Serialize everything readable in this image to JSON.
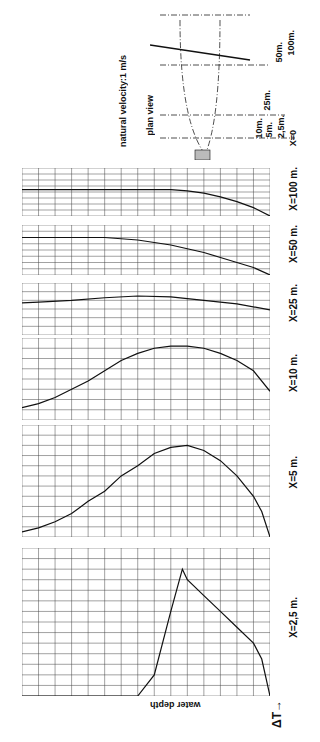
{
  "chart_data": {
    "type": "line",
    "title": "",
    "orientation": "rotated 90 degrees counter-clockwise",
    "xlabel": "water depth",
    "ylabel": "ΔT",
    "depth_ticks": [
      0,
      1,
      2,
      3,
      4,
      5,
      6,
      7,
      8,
      9,
      10,
      11,
      12,
      13,
      14,
      15
    ],
    "depth_unit": "m",
    "annotation": "natural velocity: 1 m/s",
    "inset": {
      "title": "plan view",
      "labels": [
        "100m.",
        "50m.",
        "25m.",
        "10m.",
        "5m.",
        "2,5m.",
        "X=0"
      ]
    },
    "series": [
      {
        "name": "X=2,5 m.",
        "dT_max": 14,
        "dT_ticks": [
          0,
          2,
          4,
          6,
          8,
          10,
          12,
          14,
          16
        ],
        "depth": [
          0,
          0.5,
          1,
          2,
          3,
          4,
          5,
          5.3,
          6,
          7,
          8,
          9,
          10,
          11,
          12,
          13,
          14,
          15
        ],
        "dT": [
          0,
          3.5,
          5,
          6.5,
          8,
          9.5,
          11,
          12,
          8,
          2,
          0,
          0,
          0,
          0,
          0,
          0,
          0,
          0
        ]
      },
      {
        "name": "X=5 m.",
        "dT_max": 11,
        "dT_ticks": [
          0,
          2,
          4,
          6,
          8,
          10,
          11
        ],
        "depth": [
          0,
          0.5,
          1,
          2,
          3,
          4,
          5,
          6,
          7,
          8,
          9,
          10,
          11,
          12,
          13,
          14,
          15
        ],
        "dT": [
          0,
          2.5,
          4,
          6,
          7.5,
          8.5,
          9,
          8.8,
          8.2,
          7,
          6,
          4.5,
          3.5,
          2.3,
          1.5,
          0.9,
          0.5
        ]
      },
      {
        "name": "X=10 m.",
        "dT_max": 8,
        "dT_ticks": [
          0,
          2,
          4,
          6,
          8
        ],
        "depth": [
          0,
          1,
          2,
          3,
          4,
          5,
          6,
          7,
          8,
          9,
          10,
          11,
          12,
          13,
          14,
          15
        ],
        "dT": [
          2.8,
          4.8,
          5.8,
          6.5,
          7.0,
          7.2,
          7.2,
          7.0,
          6.5,
          5.8,
          4.8,
          3.8,
          3.0,
          2.2,
          1.6,
          1.2
        ]
      },
      {
        "name": "X=25 m.",
        "dT_max": 6,
        "dT_ticks": [
          0,
          2,
          4,
          6
        ],
        "depth": [
          0,
          2,
          4,
          6,
          8,
          10,
          12,
          14,
          15
        ],
        "dT": [
          2.9,
          3.6,
          4.0,
          4.4,
          4.5,
          4.3,
          4.0,
          3.8,
          3.7
        ]
      },
      {
        "name": "X=50 m.",
        "dT_max": 4,
        "dT_ticks": [
          0,
          1,
          2,
          3,
          4
        ],
        "depth": [
          0,
          1,
          2,
          3,
          4,
          5,
          6,
          7,
          8,
          9,
          10,
          11,
          12,
          13,
          14,
          15
        ],
        "dT": [
          0,
          0.6,
          1.0,
          1.4,
          1.8,
          2.1,
          2.4,
          2.6,
          2.8,
          2.9,
          3.0,
          3.0,
          3.0,
          3.0,
          3.0,
          3.0
        ]
      },
      {
        "name": "X=100 m.",
        "dT_max": 4,
        "dT_ticks": [
          0,
          1,
          2,
          3,
          4
        ],
        "depth": [
          0,
          1,
          2,
          3,
          4,
          5,
          6,
          7,
          8,
          9,
          10,
          11,
          12,
          13,
          14,
          15
        ],
        "dT": [
          0,
          0.7,
          1.2,
          1.6,
          1.9,
          2.1,
          2.2,
          2.2,
          2.2,
          2.2,
          2.2,
          2.2,
          2.2,
          2.2,
          2.2,
          2.2
        ]
      }
    ]
  },
  "labels": {
    "velocity": "natural velocity:1 m/s",
    "plan_view": "plan view",
    "water_depth": "water depth",
    "delta_t": "ΔT→",
    "plan": [
      "100m.",
      "50m.",
      "25m.",
      "10m.",
      "5m.",
      "2,5m.",
      "X=0"
    ]
  }
}
